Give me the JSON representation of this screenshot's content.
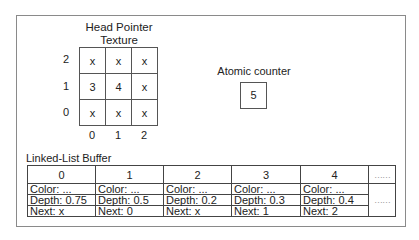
{
  "head_pointer": {
    "title_line1": "Head Pointer",
    "title_line2": "Texture",
    "row_labels": [
      "2",
      "1",
      "0"
    ],
    "col_labels": [
      "0",
      "1",
      "2"
    ],
    "cells": [
      [
        "x",
        "x",
        "x"
      ],
      [
        "3",
        "4",
        "x"
      ],
      [
        "x",
        "x",
        "x"
      ]
    ]
  },
  "atomic_counter": {
    "label": "Atomic counter",
    "value": "5"
  },
  "linked_list": {
    "title": "Linked-List Buffer",
    "nodes": [
      {
        "index": "0",
        "color": "Color:  ...",
        "depth": "Depth: 0.75",
        "next": "Next: x"
      },
      {
        "index": "1",
        "color": "Color:  ...",
        "depth": "Depth: 0.5",
        "next": "Next: 0"
      },
      {
        "index": "2",
        "color": "Color:  ...",
        "depth": "Depth: 0.2",
        "next": "Next: x"
      },
      {
        "index": "3",
        "color": "Color:  ...",
        "depth": "Depth: 0.3",
        "next": "Next: 1"
      },
      {
        "index": "4",
        "color": "Color:  ...",
        "depth": "Depth: 0.4",
        "next": "Next: 2"
      }
    ],
    "ellipsis_header": "……",
    "ellipsis_body": "……"
  }
}
